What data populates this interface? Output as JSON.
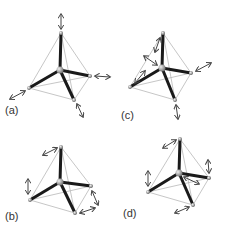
{
  "figure": {
    "panels": [
      {
        "id": "a",
        "label": "(a)"
      },
      {
        "id": "b",
        "label": "(b)"
      },
      {
        "id": "c",
        "label": "(c)"
      },
      {
        "id": "d",
        "label": "(d)"
      }
    ]
  },
  "colors": {
    "bond": "#1a1a1a",
    "edge": "#b0b0b0",
    "arrow": "#444444",
    "atom": "#999999"
  }
}
